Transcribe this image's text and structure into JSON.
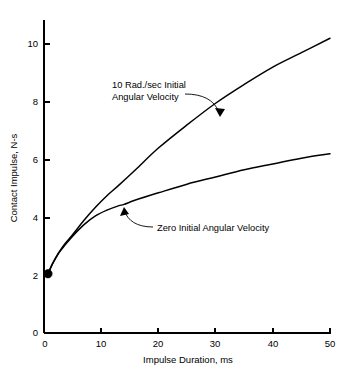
{
  "chart_data": {
    "type": "line",
    "title": "",
    "xlabel": "Impulse Duration, ms",
    "ylabel": "Contact Impulse, N-s",
    "xlim": [
      0,
      50
    ],
    "ylim": [
      0,
      11
    ],
    "xticks": [
      0,
      10,
      20,
      30,
      40,
      50
    ],
    "yticks": [
      0,
      2,
      4,
      6,
      8,
      10
    ],
    "xtick_labels": [
      "0",
      "10",
      "20",
      "30",
      "40",
      "50"
    ],
    "ytick_labels": [
      "0",
      "2",
      "4",
      "6",
      "8",
      "10"
    ],
    "grid": false,
    "legend": "annotations",
    "line_color": "#000000",
    "background_color": "#ffffff",
    "start_marker": {
      "x": 0.7,
      "y": 2.05,
      "shape": "filled-circle",
      "color": "#000000"
    },
    "series": [
      {
        "name": "10 Rad./sec Initial Angular Velocity",
        "x": [
          0.7,
          1.5,
          2.5,
          3.5,
          5,
          7,
          9,
          11,
          13,
          16,
          20,
          25,
          30,
          35,
          40,
          45,
          50
        ],
        "values": [
          2.05,
          2.4,
          2.75,
          3.05,
          3.4,
          3.9,
          4.35,
          4.75,
          5.1,
          5.65,
          6.4,
          7.2,
          7.95,
          8.6,
          9.2,
          9.7,
          10.2
        ]
      },
      {
        "name": "Zero Initial Angular Velocity",
        "x": [
          0.7,
          1.5,
          2.5,
          3.5,
          5,
          7,
          9,
          11,
          13,
          14,
          16,
          20,
          25,
          30,
          35,
          40,
          45,
          50
        ],
        "values": [
          2.05,
          2.4,
          2.75,
          3.0,
          3.35,
          3.75,
          4.05,
          4.25,
          4.4,
          4.45,
          4.6,
          4.85,
          5.15,
          5.4,
          5.65,
          5.85,
          6.05,
          6.2
        ]
      }
    ],
    "annotations": [
      {
        "id": "upper-annotation",
        "lines": [
          "10 Rad./sec Initial",
          "Angular Velocity"
        ],
        "text_x": 112,
        "text_y": 85,
        "points_to": {
          "x": 31.0,
          "y": 7.6
        }
      },
      {
        "id": "lower-annotation",
        "lines": [
          "Zero Initial Angular Velocity"
        ],
        "text_x": 155,
        "text_y": 230,
        "points_to": {
          "x": 14.0,
          "y": 4.5
        }
      }
    ]
  }
}
